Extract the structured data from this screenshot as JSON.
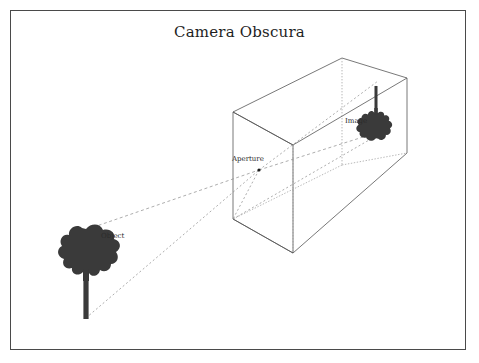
{
  "figure": {
    "title": "Camera Obscura",
    "border_color": "#4a4a4a",
    "background_color": "#ffffff"
  },
  "labels": {
    "aperture": "Aperture",
    "object": "Object",
    "image": "Image"
  },
  "colors": {
    "silhouette": "#3a3a3a",
    "box_stroke": "#555555",
    "ray_stroke": "#7a7a7a",
    "text": "#2b2b2b"
  },
  "geometry": {
    "box_front_face": [
      [
        233,
        112
      ],
      [
        233,
        219
      ],
      [
        293,
        253
      ],
      [
        293,
        145
      ]
    ],
    "box_back_face": [
      [
        342,
        58
      ],
      [
        342,
        165
      ],
      [
        407,
        153
      ],
      [
        407,
        78
      ]
    ],
    "aperture_point": [
      259,
      170
    ],
    "object_tree_base": [
      86,
      315
    ],
    "image_tree_base": [
      376,
      86
    ]
  },
  "elements": {
    "object_silhouette": "tree-silhouette-upright",
    "image_silhouette": "tree-silhouette-inverted",
    "aperture_marker": "aperture-dot",
    "rays": "light-ray-lines-dashed"
  }
}
